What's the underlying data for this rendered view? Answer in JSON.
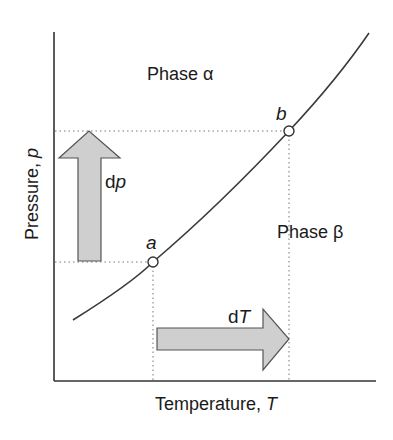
{
  "diagram": {
    "type": "phase-boundary",
    "axes": {
      "x_label": "Temperature, ",
      "x_symbol": "T",
      "y_label": "Pressure, ",
      "y_symbol": "p"
    },
    "regions": {
      "alpha": "Phase α",
      "beta": "Phase β"
    },
    "points": {
      "a": "a",
      "b": "b"
    },
    "arrows": {
      "dp_prefix": "d",
      "dp_symbol": "p",
      "dT_prefix": "d",
      "dT_symbol": "T"
    },
    "colors": {
      "axis": "#333333",
      "curve": "#3a3a3a",
      "arrow_fill": "#cfcfcf",
      "arrow_stroke": "#555555",
      "guide": "#777777"
    }
  }
}
